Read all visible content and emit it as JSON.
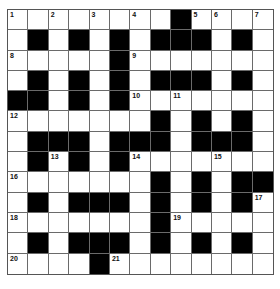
{
  "puzzle": {
    "rows": 13,
    "cols": 13,
    "colors": {
      "block": "#000000",
      "cell": "#ffffff",
      "line": "#6a6a6a"
    },
    "layout": [
      "0000000010000",
      "0101010111010",
      "0000010000000",
      "0101010111010",
      "1101010000000",
      "0000000101010",
      "0111011101110",
      "0101010000000",
      "0000000101011",
      "0101110101010",
      "0000000100000",
      "0101110101010",
      "0000100000000"
    ],
    "numbers": [
      {
        "r": 0,
        "c": 0,
        "n": "1"
      },
      {
        "r": 0,
        "c": 2,
        "n": "2"
      },
      {
        "r": 0,
        "c": 4,
        "n": "3"
      },
      {
        "r": 0,
        "c": 6,
        "n": "4"
      },
      {
        "r": 0,
        "c": 9,
        "n": "5"
      },
      {
        "r": 0,
        "c": 10,
        "n": "6"
      },
      {
        "r": 0,
        "c": 12,
        "n": "7"
      },
      {
        "r": 2,
        "c": 0,
        "n": "8"
      },
      {
        "r": 2,
        "c": 6,
        "n": "9"
      },
      {
        "r": 4,
        "c": 6,
        "n": "10"
      },
      {
        "r": 4,
        "c": 8,
        "n": "11"
      },
      {
        "r": 5,
        "c": 0,
        "n": "12"
      },
      {
        "r": 7,
        "c": 2,
        "n": "13"
      },
      {
        "r": 7,
        "c": 6,
        "n": "14"
      },
      {
        "r": 7,
        "c": 10,
        "n": "15"
      },
      {
        "r": 8,
        "c": 0,
        "n": "16"
      },
      {
        "r": 9,
        "c": 12,
        "n": "17"
      },
      {
        "r": 10,
        "c": 0,
        "n": "18"
      },
      {
        "r": 10,
        "c": 8,
        "n": "19"
      },
      {
        "r": 12,
        "c": 0,
        "n": "20"
      },
      {
        "r": 12,
        "c": 5,
        "n": "21"
      }
    ]
  }
}
